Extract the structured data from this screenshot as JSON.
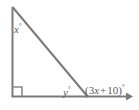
{
  "figure": {
    "type": "geometry-diagram",
    "shape": "right-triangle-with-extended-base",
    "background_color": "#ffffff",
    "stroke_color": "#7a7a7a",
    "text_color": "#5b5b5b",
    "stroke_width": 2,
    "width": 139,
    "height": 110
  },
  "vertices": {
    "apex": {
      "name": "top-vertex",
      "x": 12,
      "y": 7
    },
    "right_angle": {
      "name": "bottom-left-vertex",
      "x": 12,
      "y": 96
    },
    "base_right": {
      "name": "bottom-right-vertex",
      "x": 87,
      "y": 96
    },
    "ray_end": {
      "name": "ray-arrow-tip",
      "x": 131,
      "y": 96
    }
  },
  "markers": {
    "right_angle_square": {
      "present": true,
      "at": "bottom-left-vertex",
      "size": 9
    },
    "ray_arrowhead": {
      "present": true,
      "at": "right-end-of-base",
      "direction": "right"
    }
  },
  "labels": {
    "apex_angle": {
      "variable": "x",
      "degree_symbol": "°",
      "full_text": "x°",
      "position": "interior-top-left"
    },
    "interior_base_angle": {
      "variable": "y",
      "degree_symbol": "°",
      "full_text": "y°",
      "position": "interior-bottom-right"
    },
    "exterior_angle": {
      "open_paren": "(",
      "coefficient": "3",
      "variable": "x",
      "operator": "+",
      "constant": "10",
      "close_paren": ")",
      "degree_symbol": "°",
      "full_text": "(3x + 10)°",
      "position": "right-of-bottom-right-vertex"
    }
  }
}
